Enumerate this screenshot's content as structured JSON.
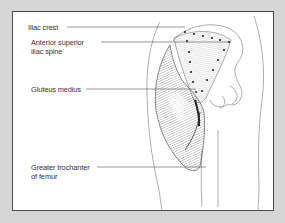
{
  "diagram": {
    "labels": [
      {
        "id": "iliac-crest",
        "lines": [
          "Iliac crest"
        ]
      },
      {
        "id": "asis",
        "lines": [
          "Anterior  superior",
          "iliac spine"
        ]
      },
      {
        "id": "gluteus-medius",
        "lines": [
          "Gluteus medius"
        ]
      },
      {
        "id": "greater-trochanter",
        "lines": [
          "Greater trochanter",
          "of femur"
        ]
      }
    ],
    "colors": {
      "background": "#d6d6d6",
      "panel": "#ffffff",
      "border": "#4a4a4a",
      "text": "#333333",
      "leader_line": "#555555"
    }
  }
}
